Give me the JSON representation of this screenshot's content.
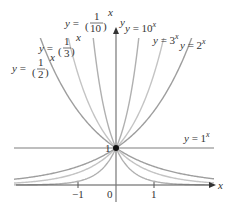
{
  "diagram": {
    "axes": {
      "x_label": "x",
      "y_label": "y",
      "origin_label": "0",
      "x_ticks": [
        {
          "value": -1,
          "label": "−1"
        },
        {
          "value": 1,
          "label": "1"
        }
      ],
      "y_ticks": [
        {
          "value": 1,
          "label": "1"
        }
      ]
    },
    "curves": [
      {
        "name": "y = 10^x",
        "base": 10,
        "label_prefix": "y = 10",
        "label_exp": "x",
        "color": "#b0b0b0"
      },
      {
        "name": "y = 3^x",
        "base": 3,
        "label_prefix": "y = 3",
        "label_exp": "x",
        "color": "#c4c4c4"
      },
      {
        "name": "y = 2^x",
        "base": 2,
        "label_prefix": "y = 2",
        "label_exp": "x",
        "color": "#9e9e9e"
      },
      {
        "name": "y = 1^x",
        "base": 1,
        "label_prefix": "y = 1",
        "label_exp": "x",
        "color": "#a8a8a8"
      },
      {
        "name": "y = (1/2)^x",
        "base": 0.5,
        "label_prefix": "y =",
        "label_num": "1",
        "label_den": "2",
        "label_exp": "x",
        "color": "#9e9e9e"
      },
      {
        "name": "y = (1/3)^x",
        "base": 0.3333,
        "label_prefix": "y =",
        "label_num": "1",
        "label_den": "3",
        "label_exp": "x",
        "color": "#c4c4c4"
      },
      {
        "name": "y = (1/10)^x",
        "base": 0.1,
        "label_prefix": "y =",
        "label_num": "1",
        "label_den": "10",
        "label_exp": "x",
        "color": "#b0b0b0"
      }
    ],
    "common_point": {
      "x": 0,
      "y": 1,
      "label": "(0, 1)"
    }
  }
}
